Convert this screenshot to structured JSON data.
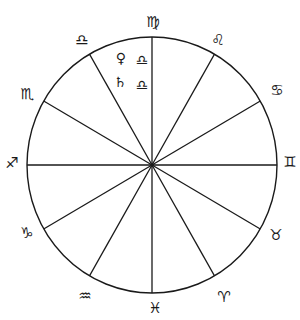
{
  "chart_data": {
    "type": "diagram",
    "title": "",
    "wheel": {
      "center": [
        152,
        165
      ],
      "rx": 125,
      "ry": 128,
      "sector_count": 12,
      "spoke_angles_deg": [
        0,
        30,
        60,
        90,
        120,
        150,
        180,
        210,
        240,
        270,
        300,
        330
      ]
    },
    "signs": [
      {
        "name": "Virgo",
        "glyph": "♍",
        "position": [
          153,
          22
        ]
      },
      {
        "name": "Leo",
        "glyph": "♌",
        "position": [
          218,
          40
        ]
      },
      {
        "name": "Cancer",
        "glyph": "♋",
        "position": [
          277,
          90
        ]
      },
      {
        "name": "Gemini",
        "glyph": "♊",
        "position": [
          290,
          162
        ]
      },
      {
        "name": "Taurus",
        "glyph": "♉",
        "position": [
          276,
          235
        ]
      },
      {
        "name": "Aries",
        "glyph": "♈",
        "position": [
          224,
          297
        ]
      },
      {
        "name": "Pisces",
        "glyph": "♓",
        "position": [
          155,
          308
        ]
      },
      {
        "name": "Aquarius",
        "glyph": "♒",
        "position": [
          85,
          296
        ]
      },
      {
        "name": "Capricorn",
        "glyph": "♑",
        "position": [
          27,
          233
        ]
      },
      {
        "name": "Sagittarius",
        "glyph": "♐",
        "position": [
          12,
          163
        ]
      },
      {
        "name": "Scorpio",
        "glyph": "♏",
        "position": [
          27,
          94
        ]
      },
      {
        "name": "Libra",
        "glyph": "♎",
        "position": [
          82,
          40
        ]
      }
    ],
    "placements": [
      {
        "planet": "Venus",
        "planet_glyph": "♀",
        "sign": "Libra",
        "sign_glyph": "♎",
        "planet_position": [
          121,
          58
        ],
        "sign_position": [
          142,
          60
        ]
      },
      {
        "planet": "Saturn",
        "planet_glyph": "♄",
        "sign": "Libra",
        "sign_glyph": "♎",
        "planet_position": [
          120,
          82
        ],
        "sign_position": [
          142,
          85
        ]
      }
    ]
  },
  "labels": {
    "virgo": "♍",
    "leo": "♌",
    "cancer": "♋",
    "gemini": "♊",
    "taurus": "♉",
    "aries": "♈",
    "pisces": "♓",
    "aquarius": "♒",
    "capricorn": "♑",
    "sagittarius": "♐",
    "scorpio": "♏",
    "libra": "♎",
    "venus": "♀",
    "saturn": "♄",
    "venus_sign": "♎",
    "saturn_sign": "♎"
  },
  "colors": {
    "ink": "#1a1a1a",
    "paper": "#ffffff"
  }
}
